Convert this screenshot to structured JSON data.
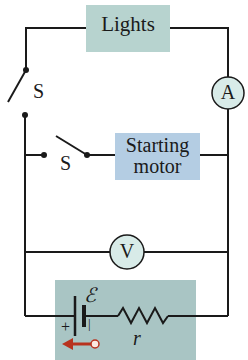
{
  "diagram": {
    "type": "circuit",
    "components": {
      "lights": {
        "label": "Lights",
        "fill": "#b7d3cf"
      },
      "ammeter": {
        "label": "A",
        "fill": "#d8ebe8"
      },
      "switch_upper": {
        "label": "S"
      },
      "switch_lower": {
        "label": "S"
      },
      "starting_motor": {
        "label_line1": "Starting",
        "label_line2": "motor",
        "fill": "#b4cde3"
      },
      "voltmeter": {
        "label": "V",
        "fill": "#d8ebe8"
      },
      "battery": {
        "emf_label": "ℰ",
        "plus_label": "+",
        "minus_label": "−",
        "resistor_label": "r",
        "fill": "#a9c5c4"
      }
    },
    "colors": {
      "wire": "#1a1a1a",
      "arrow": "#b8321e",
      "background": "#ffffff"
    }
  }
}
